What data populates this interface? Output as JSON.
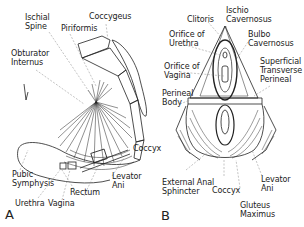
{
  "panels": [
    {
      "id": "A",
      "letter": "A",
      "labels": {
        "ischial_spine": "Ischial\nSpine",
        "piriformis": "Piriformis",
        "coccygeus": "Coccygeus",
        "obturator_internus": "Obturator\nInternus",
        "coccyx": "Coccyx",
        "levator_ani": "Levator\nAni",
        "pubic_symphysis": "Pubic\nSymphysis",
        "rectum": "Rectum",
        "urethra": "Urethra",
        "vagina": "Vagina"
      }
    },
    {
      "id": "B",
      "letter": "B",
      "labels": {
        "clitoris": "Clitoris",
        "ischio_cavernosus": "Ischio\nCavernosus",
        "orifice_of_urethra": "Orifice of\nUrethra",
        "bulbo_cavernosus": "Bulbo\nCavernosus",
        "orifice_of_vagina": "Orifice of\nVagina",
        "superficial_transverse_perineal": "Superficial\nTransverse\nPerineal",
        "perineal_body": "Perineal\nBody",
        "external_anal_sphincter": "External Anal\nSphincter",
        "coccyx": "Coccyx",
        "levator_ani": "Levator\nAni",
        "gluteus_maximus": "Gluteus\nMaximus"
      }
    }
  ],
  "colors": {
    "line": "#222222",
    "leader": "#888888",
    "background": "#ffffff"
  }
}
